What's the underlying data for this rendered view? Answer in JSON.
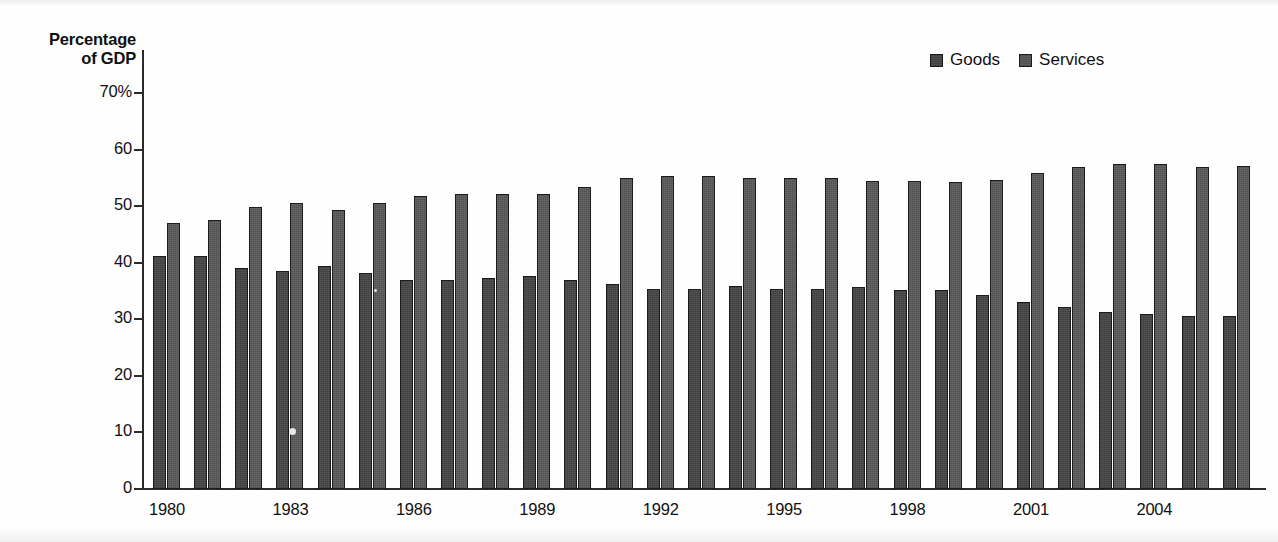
{
  "chart_data": {
    "type": "bar",
    "title": "",
    "xlabel": "",
    "ylabel": "Percentage of GDP",
    "ylim": [
      0,
      70
    ],
    "yticks": [
      "0",
      "10",
      "20",
      "30",
      "40",
      "50",
      "60",
      "70%"
    ],
    "grid": false,
    "legend_position": "top-right",
    "categories": [
      "1980",
      "1981",
      "1982",
      "1983",
      "1984",
      "1985",
      "1986",
      "1987",
      "1988",
      "1989",
      "1990",
      "1991",
      "1992",
      "1993",
      "1994",
      "1995",
      "1996",
      "1997",
      "1998",
      "1999",
      "2000",
      "2001",
      "2002",
      "2003",
      "2004",
      "2005",
      "2006"
    ],
    "tick_labels": [
      "1980",
      "1983",
      "1986",
      "1989",
      "1992",
      "1995",
      "1998",
      "2001",
      "2004"
    ],
    "series": [
      {
        "name": "Goods",
        "color": "#545454",
        "values": [
          41.2,
          41.2,
          39.1,
          38.6,
          39.4,
          38.2,
          36.9,
          36.9,
          37.3,
          37.7,
          36.9,
          36.3,
          35.4,
          35.4,
          35.8,
          35.3,
          35.3,
          35.7,
          35.2,
          35.2,
          34.3,
          33.0,
          32.1,
          31.3,
          31.0,
          30.6,
          30.5
        ]
      },
      {
        "name": "Services",
        "color": "#5d5d5d",
        "values": [
          47.1,
          47.5,
          49.9,
          50.6,
          49.4,
          50.6,
          51.8,
          52.1,
          52.1,
          52.1,
          53.4,
          54.9,
          55.3,
          55.3,
          54.9,
          54.9,
          54.9,
          54.4,
          54.4,
          54.3,
          54.6,
          55.9,
          57.0,
          57.5,
          57.4,
          57.0,
          57.1
        ]
      }
    ]
  },
  "legend": {
    "items": [
      {
        "label": "Goods"
      },
      {
        "label": "Services"
      }
    ]
  },
  "axis": {
    "y_title_line1": "Percentage",
    "y_title_line2": "of GDP"
  }
}
